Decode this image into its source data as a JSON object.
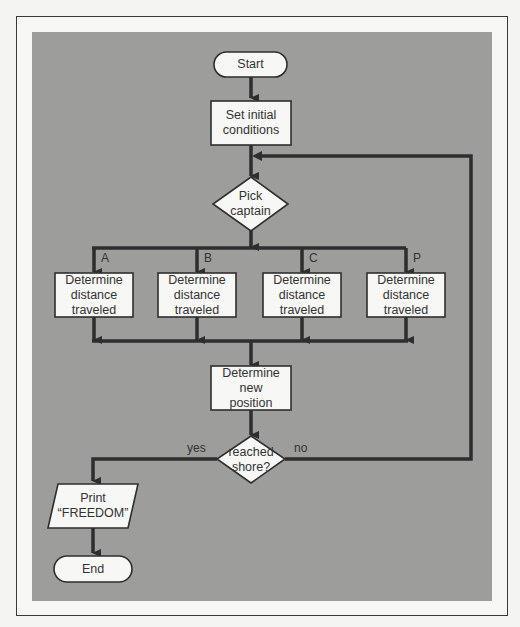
{
  "flowchart": {
    "nodes": {
      "start": {
        "shape": "terminal",
        "label": "Start"
      },
      "init": {
        "shape": "process",
        "label": "Set initial\nconditions"
      },
      "pick": {
        "shape": "decision",
        "label": "Pick\ncaptain"
      },
      "dist_a": {
        "shape": "process",
        "label": "Determine\ndistance\ntraveled",
        "branch": "A"
      },
      "dist_b": {
        "shape": "process",
        "label": "Determine\ndistance\ntraveled",
        "branch": "B"
      },
      "dist_c": {
        "shape": "process",
        "label": "Determine\ndistance\ntraveled",
        "branch": "C"
      },
      "dist_p": {
        "shape": "process",
        "label": "Determine\ndistance\ntraveled",
        "branch": "P"
      },
      "newpos": {
        "shape": "process",
        "label": "Determine\nnew\nposition"
      },
      "shore": {
        "shape": "decision",
        "label": "reached\nshore?"
      },
      "print": {
        "shape": "io",
        "label": "Print\n“FREEDOM”"
      },
      "end": {
        "shape": "terminal",
        "label": "End"
      }
    },
    "branch_labels": {
      "a": "A",
      "b": "B",
      "c": "C",
      "p": "P"
    },
    "edge_labels": {
      "yes": "yes",
      "no": "no"
    },
    "edges": [
      [
        "start",
        "init"
      ],
      [
        "init",
        "pick"
      ],
      [
        "pick",
        "dist_a"
      ],
      [
        "pick",
        "dist_b"
      ],
      [
        "pick",
        "dist_c"
      ],
      [
        "pick",
        "dist_p"
      ],
      [
        "dist_a",
        "newpos"
      ],
      [
        "dist_b",
        "newpos"
      ],
      [
        "dist_c",
        "newpos"
      ],
      [
        "dist_p",
        "newpos"
      ],
      [
        "newpos",
        "shore"
      ],
      [
        "shore",
        "print",
        "yes"
      ],
      [
        "shore",
        "pick",
        "no"
      ],
      [
        "print",
        "end"
      ]
    ]
  },
  "colors": {
    "panel": "#9d9d9b",
    "node_fill": "#f7f7f5",
    "line": "#2e2e2e",
    "text": "#333333"
  }
}
